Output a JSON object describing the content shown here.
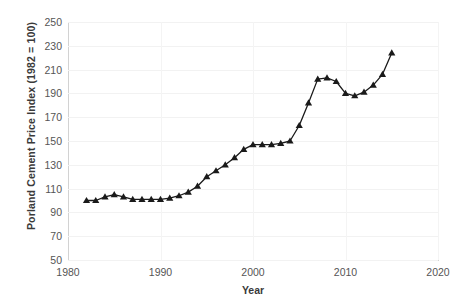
{
  "chart_data": {
    "type": "line",
    "title": "",
    "xlabel": "Year",
    "ylabel": "Porland  Cement Price Index (1982 = 100)",
    "xlim": [
      1980,
      2020
    ],
    "ylim": [
      50,
      250
    ],
    "xticks": [
      1980,
      1990,
      2000,
      2010,
      2020
    ],
    "yticks": [
      50,
      70,
      90,
      110,
      130,
      150,
      170,
      190,
      210,
      230,
      250
    ],
    "grid": true,
    "legend": "none",
    "marker": "triangle",
    "line_color": "#1a1a1a",
    "marker_color": "#1a1a1a",
    "x": [
      1982,
      1983,
      1984,
      1985,
      1986,
      1987,
      1988,
      1989,
      1990,
      1991,
      1992,
      1993,
      1994,
      1995,
      1996,
      1997,
      1998,
      1999,
      2000,
      2001,
      2002,
      2003,
      2004,
      2005,
      2006,
      2007,
      2008,
      2009,
      2010,
      2011,
      2012,
      2013,
      2014,
      2015
    ],
    "values": [
      100,
      100,
      103,
      105,
      103,
      101,
      101,
      101,
      101,
      102,
      104,
      107,
      112,
      120,
      125,
      130,
      136,
      143,
      147,
      147,
      147,
      148,
      150,
      163,
      182,
      202,
      203,
      200,
      190,
      188,
      191,
      197,
      206,
      224
    ]
  },
  "axis": {
    "y_title": "Porland  Cement Price Index (1982 = 100)",
    "x_title": "Year",
    "y_ticks": [
      "250",
      "230",
      "210",
      "190",
      "170",
      "150",
      "130",
      "110",
      "90",
      "70",
      "50"
    ],
    "x_ticks": [
      "1980",
      "1990",
      "2000",
      "2010",
      "2020"
    ]
  },
  "title_sliver": ""
}
